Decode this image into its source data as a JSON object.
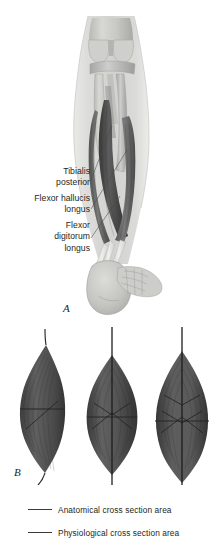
{
  "figure": {
    "panel_a": {
      "letter": "A",
      "labels": [
        {
          "id": "tibialis-posterior",
          "lines": [
            "Tibialis",
            "posterior"
          ]
        },
        {
          "id": "flexor-hallucis-longus",
          "lines": [
            "Flexor hallucis",
            "longus"
          ]
        },
        {
          "id": "flexor-digitorum-longus",
          "lines": [
            "Flexor",
            "digitorum",
            "longus"
          ]
        }
      ]
    },
    "panel_b": {
      "letter": "B",
      "muscles": [
        {
          "id": "muscle-fusiform-asymmetric",
          "shape": "fusiform"
        },
        {
          "id": "muscle-unipennate",
          "shape": "pennate"
        },
        {
          "id": "muscle-bipennate",
          "shape": "bipennate"
        }
      ]
    },
    "legend": [
      {
        "id": "anatomical",
        "label": "Anatomical cross section area",
        "color": "#3a3a3a"
      },
      {
        "id": "physiological",
        "label": "Physiological cross section area",
        "color": "#3a3a3a"
      }
    ]
  }
}
